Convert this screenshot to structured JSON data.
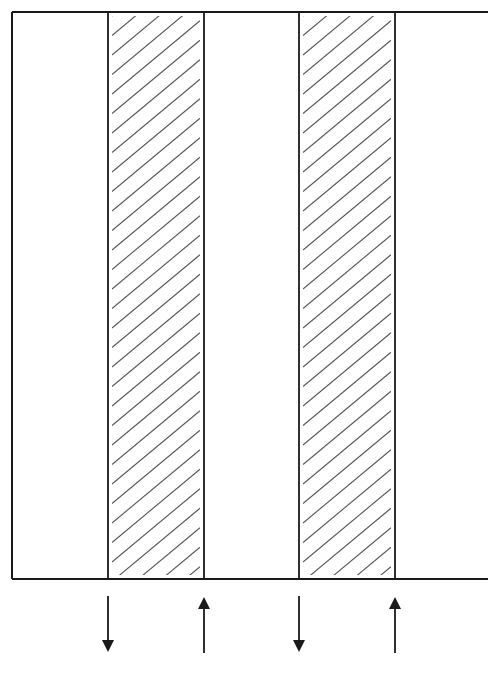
{
  "diagram": {
    "type": "counterflow-channel-schematic",
    "frame": {
      "left": 12,
      "top": 12,
      "right": 488,
      "bottom": 579,
      "right_border": false
    },
    "columns": [
      {
        "id": "clear-1",
        "x0": 12,
        "x1": 108,
        "hatched": false
      },
      {
        "id": "hatched-1",
        "x0": 108,
        "x1": 204,
        "hatched": true
      },
      {
        "id": "clear-2",
        "x0": 204,
        "x1": 299,
        "hatched": false
      },
      {
        "id": "hatched-2",
        "x0": 299,
        "x1": 395,
        "hatched": true
      },
      {
        "id": "clear-3",
        "x0": 395,
        "x1": 488,
        "hatched": false
      }
    ],
    "hatch": {
      "spacing": 19.5,
      "dx": 84,
      "dy": 70,
      "inset": 4,
      "color": "#555555"
    },
    "arrows": [
      {
        "id": "arrow-1",
        "direction": "down",
        "x": 108,
        "y_top": 596,
        "y_bottom": 652
      },
      {
        "id": "arrow-2",
        "direction": "up",
        "x": 204,
        "y_top": 597,
        "y_bottom": 653
      },
      {
        "id": "arrow-3",
        "direction": "down",
        "x": 299,
        "y_top": 596,
        "y_bottom": 652
      },
      {
        "id": "arrow-4",
        "direction": "up",
        "x": 395,
        "y_top": 597,
        "y_bottom": 653
      }
    ],
    "colors": {
      "line": "#1a1a1a",
      "background": "#ffffff"
    }
  }
}
